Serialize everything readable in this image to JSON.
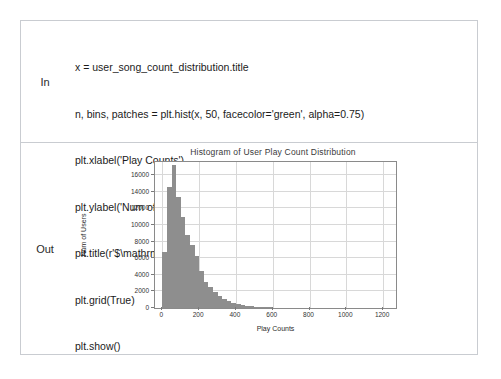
{
  "notebook": {
    "in_label": "In",
    "out_label": "Out",
    "code_lines": [
      "x = user_song_count_distribution.title",
      "n, bins, patches = plt.hist(x, 50, facecolor='green', alpha=0.75)",
      "plt.xlabel('Play Counts')",
      "plt.ylabel('Num of Users')",
      "plt.title(r'$\\mathrm{Histogram\\ of\\ User\\ Play\\ Count\\ Distribution}\\ $')",
      "plt.grid(True)",
      "plt.show()"
    ]
  },
  "colors": {
    "bar_fill": "#8e8e8e",
    "grid": "#d8d8d8",
    "frame": "#8a8a8a",
    "cell_border": "#c9ccd1",
    "text": "#1b1b1b"
  },
  "chart_data": {
    "type": "bar",
    "title": "Histogram of User Play Count Distribution",
    "xlabel": "Play Counts",
    "ylabel": "Num of Users",
    "grid": true,
    "legend": null,
    "bins": 50,
    "xlim": [
      -40,
      1270
    ],
    "ylim": [
      0,
      17600
    ],
    "xticks": [
      0,
      200,
      400,
      600,
      800,
      1000,
      1200
    ],
    "xticklabels": [
      "0",
      "200",
      "400",
      "600",
      "800",
      "1000",
      "1200"
    ],
    "yticks": [
      0,
      2000,
      4000,
      6000,
      8000,
      10000,
      12000,
      14000,
      16000
    ],
    "yticklabels": [
      "0",
      "2000",
      "4000",
      "6000",
      "8000",
      "10000",
      "12000",
      "14000",
      "16000"
    ],
    "bin_width": 25,
    "bin_starts": [
      0,
      25,
      50,
      75,
      100,
      125,
      150,
      175,
      200,
      225,
      250,
      275,
      300,
      325,
      350,
      375,
      400,
      425,
      450,
      475,
      500,
      525,
      550,
      575,
      600,
      625,
      650,
      675,
      700,
      725,
      750,
      775,
      800,
      825,
      850,
      875,
      900,
      925,
      950,
      975,
      1000,
      1025,
      1050,
      1075,
      1100,
      1125,
      1150,
      1175,
      1200,
      1225
    ],
    "values": [
      6700,
      14600,
      17200,
      13400,
      11000,
      8800,
      7600,
      6300,
      4500,
      3100,
      2500,
      1900,
      1450,
      1050,
      800,
      620,
      470,
      360,
      280,
      210,
      160,
      120,
      95,
      75,
      58,
      45,
      36,
      28,
      22,
      17,
      14,
      11,
      9,
      7,
      6,
      5,
      4,
      3,
      3,
      2,
      2,
      2,
      1,
      1,
      1,
      1,
      1,
      1,
      1,
      1
    ]
  }
}
